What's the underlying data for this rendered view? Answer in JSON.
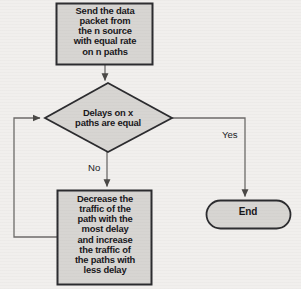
{
  "diagram": {
    "type": "flowchart",
    "background_color": "#f1efed",
    "node_fill_color": "#d7d5d2",
    "node_border_color": "#2b2b2e",
    "connector_color": "#6d6b69",
    "text_color": "#17171a",
    "nodes": [
      {
        "id": "process-start",
        "shape": "rectangle",
        "text": "Send the data\npacket from\nthe n source\nwith equal rate\non n paths"
      },
      {
        "id": "decision",
        "shape": "diamond",
        "text": "Delays on x\npaths are equal"
      },
      {
        "id": "process-adjust",
        "shape": "rectangle",
        "text": "Decrease the\ntraffic of the\npath with the\nmost delay\nand increase\nthe traffic of\nthe paths with\nless delay"
      },
      {
        "id": "terminator-end",
        "shape": "rounded-terminator",
        "text": "End"
      }
    ],
    "edges": [
      {
        "id": "edge-start-to-decision",
        "from": "process-start",
        "to": "decision",
        "label": ""
      },
      {
        "id": "edge-decision-no",
        "from": "decision",
        "to": "process-adjust",
        "label": "No"
      },
      {
        "id": "edge-decision-yes",
        "from": "decision",
        "to": "terminator-end",
        "label": "Yes"
      },
      {
        "id": "edge-feedback-loop",
        "from": "process-adjust",
        "to": "decision",
        "label": ""
      }
    ]
  }
}
